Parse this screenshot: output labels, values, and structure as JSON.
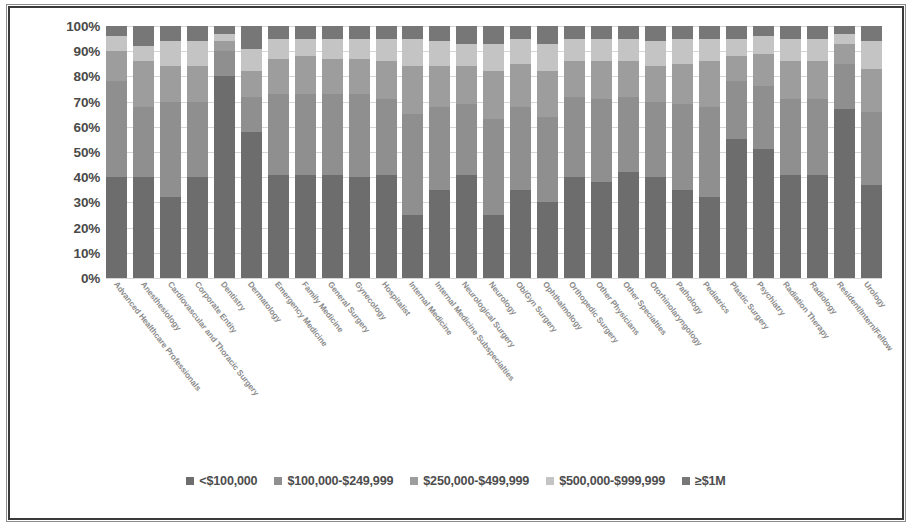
{
  "chart_data": {
    "type": "bar",
    "subtype": "stacked-100-percent",
    "title": "",
    "xlabel": "",
    "ylabel": "",
    "ylim": [
      0,
      100
    ],
    "grid": true,
    "legend_position": "bottom",
    "ytick_labels": [
      "100%",
      "90%",
      "80%",
      "70%",
      "60%",
      "50%",
      "40%",
      "30%",
      "20%",
      "10%",
      "0%"
    ],
    "ytick_values": [
      100,
      90,
      80,
      70,
      60,
      50,
      40,
      30,
      20,
      10,
      0
    ],
    "categories": [
      "Advanced Healthcare Professionals",
      "Anesthesiology",
      "Cardiovascular and Thoracic Surgery",
      "Corporate Entity",
      "Dentistry",
      "Dermatology",
      "Emergency Medicine",
      "Family Medicine",
      "General Surgery",
      "Gynecology",
      "Hospitalist",
      "Internal Medicine",
      "Internal Medicine Subspecialties",
      "Neurological Surgery",
      "Neurology",
      "Ob/Gyn Surgery",
      "Ophthalmology",
      "Orthopedic Surgery",
      "Other Physicians",
      "Other Specialties",
      "Otorhinolaryngology",
      "Pathology",
      "Pediatrics",
      "Plastic Surgery",
      "Psychiatry",
      "Radiation Therapy",
      "Radiology",
      "Resident/Intern/Fellow",
      "Urology"
    ],
    "series": [
      {
        "name": "<$100,000",
        "color": "#6d6d6d",
        "values": [
          40,
          40,
          32,
          40,
          80,
          58,
          41,
          41,
          41,
          40,
          41,
          25,
          35,
          41,
          25,
          35,
          30,
          40,
          38,
          42,
          40,
          35,
          32,
          55,
          51,
          41,
          41,
          67,
          37
        ]
      },
      {
        "name": "$100,000-$249,999",
        "color": "#8f8f8f",
        "values": [
          38,
          28,
          38,
          30,
          10,
          14,
          32,
          32,
          32,
          33,
          30,
          40,
          33,
          28,
          38,
          33,
          34,
          32,
          33,
          30,
          30,
          34,
          36,
          23,
          25,
          30,
          30,
          18,
          29
        ]
      },
      {
        "name": "$250,000-$499,999",
        "color": "#9d9d9d",
        "values": [
          12,
          18,
          14,
          14,
          4,
          10,
          14,
          15,
          14,
          14,
          15,
          19,
          16,
          15,
          19,
          17,
          18,
          14,
          15,
          14,
          14,
          16,
          18,
          10,
          13,
          15,
          15,
          8,
          17
        ]
      },
      {
        "name": "$500,000-$999,999",
        "color": "#c4c4c4",
        "values": [
          6,
          6,
          10,
          10,
          3,
          9,
          8,
          7,
          8,
          8,
          9,
          11,
          10,
          9,
          11,
          10,
          11,
          9,
          9,
          9,
          10,
          10,
          9,
          7,
          7,
          9,
          9,
          4,
          11
        ]
      },
      {
        "name": "≥$1M",
        "color": "#777777",
        "values": [
          4,
          8,
          6,
          6,
          3,
          9,
          5,
          5,
          5,
          5,
          5,
          5,
          6,
          7,
          7,
          5,
          7,
          5,
          5,
          5,
          6,
          5,
          5,
          5,
          4,
          5,
          5,
          3,
          6
        ]
      }
    ]
  },
  "legend": {
    "items": [
      {
        "label": "<$100,000",
        "color": "#6d6d6d"
      },
      {
        "label": "$100,000-$249,999",
        "color": "#8f8f8f"
      },
      {
        "label": "$250,000-$499,999",
        "color": "#9d9d9d"
      },
      {
        "label": "$500,000-$999,999",
        "color": "#c4c4c4"
      },
      {
        "label": "≥$1M",
        "color": "#777777"
      }
    ]
  }
}
